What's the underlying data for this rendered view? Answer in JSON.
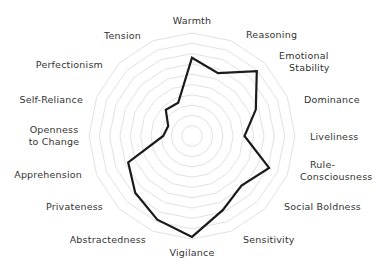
{
  "chart_data": {
    "type": "radar",
    "title": "",
    "center": [
      192,
      136
    ],
    "radius": 103,
    "rings": 10,
    "range": [
      0,
      10
    ],
    "grid": true,
    "legend": "none",
    "colors": {
      "line": "#1a1a1a",
      "grid": "#e2e2e2",
      "text": "#333333",
      "background": "#ffffff"
    },
    "categories": [
      "Warmth",
      "Reasoning",
      "Emotional Stability",
      "Dominance",
      "Liveliness",
      "Rule-Consciousness",
      "Social Boldness",
      "Sensitivity",
      "Vigilance",
      "Abstractedness",
      "Privateness",
      "Apprehension",
      "Openness to Change",
      "Self-Reliance",
      "Perfectionism",
      "Tension"
    ],
    "series": [
      {
        "name": "Profile",
        "values": [
          7.6,
          6.6,
          8.9,
          6.7,
          5.1,
          8.1,
          6.8,
          7.8,
          9.8,
          8.8,
          7.8,
          6.7,
          2.8,
          2.5,
          3.6,
          3.5
        ]
      }
    ],
    "labels": [
      {
        "lines": [
          "Warmth"
        ],
        "x": 192,
        "y": 24,
        "anchor": "middle"
      },
      {
        "lines": [
          "Reasoning"
        ],
        "x": 246,
        "y": 38,
        "anchor": "start"
      },
      {
        "lines": [
          "Emotional",
          "Stability"
        ],
        "x": 279,
        "y": 59,
        "anchor": "start",
        "align": [
          "start",
          "indent"
        ]
      },
      {
        "lines": [
          "Dominance"
        ],
        "x": 304,
        "y": 103,
        "anchor": "start"
      },
      {
        "lines": [
          "Liveliness"
        ],
        "x": 310,
        "y": 140,
        "anchor": "start"
      },
      {
        "lines": [
          "Rule-",
          "Consciousness"
        ],
        "x": 300,
        "y": 168,
        "anchor": "start",
        "align": [
          "indent",
          "start"
        ]
      },
      {
        "lines": [
          "Social Boldness"
        ],
        "x": 284,
        "y": 210,
        "anchor": "start"
      },
      {
        "lines": [
          "Sensitivity"
        ],
        "x": 243,
        "y": 243,
        "anchor": "start"
      },
      {
        "lines": [
          "Vigilance"
        ],
        "x": 192,
        "y": 256,
        "anchor": "middle"
      },
      {
        "lines": [
          "Abstractedness"
        ],
        "x": 146,
        "y": 243,
        "anchor": "end"
      },
      {
        "lines": [
          "Privateness"
        ],
        "x": 103,
        "y": 210,
        "anchor": "end"
      },
      {
        "lines": [
          "Apprehension"
        ],
        "x": 82,
        "y": 178,
        "anchor": "end"
      },
      {
        "lines": [
          "Openness",
          "to Change"
        ],
        "x": 54,
        "y": 133,
        "anchor": "middle"
      },
      {
        "lines": [
          "Self-Reliance"
        ],
        "x": 83,
        "y": 103,
        "anchor": "end"
      },
      {
        "lines": [
          "Perfectionism"
        ],
        "x": 103,
        "y": 68,
        "anchor": "end"
      },
      {
        "lines": [
          "Tension"
        ],
        "x": 141,
        "y": 39,
        "anchor": "end"
      }
    ]
  }
}
